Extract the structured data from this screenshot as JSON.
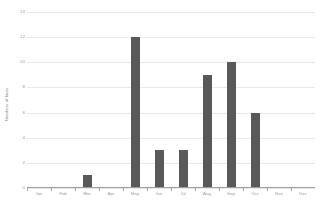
{
  "chart_data": {
    "type": "bar",
    "title": "",
    "subtitle": "",
    "xlabel": "",
    "ylabel": "Numbers of birds",
    "categories": [
      "Jan",
      "Feb",
      "Mar",
      "Apr",
      "May",
      "Jun",
      "Jul",
      "Aug",
      "Sep",
      "Oct",
      "Nov",
      "Dec"
    ],
    "values": [
      0,
      0,
      1,
      0,
      12,
      3,
      3,
      9,
      10,
      6,
      0,
      0
    ],
    "ylim": [
      0,
      14
    ],
    "ytick_values": [
      0,
      2,
      4,
      6,
      8,
      10,
      12,
      14
    ],
    "ytick_labels": [
      "0",
      "2",
      "4",
      "6",
      "8",
      "10",
      "12",
      "14"
    ],
    "grid": true,
    "grid_axis": "y",
    "legend": false,
    "legend_position": "none",
    "bar_color": "#595959",
    "gridline_color": "#e9e9e9",
    "axis_color": "#9e9e9e",
    "tick_label_color": "#9a9a9a",
    "background_color": "#ffffff"
  }
}
